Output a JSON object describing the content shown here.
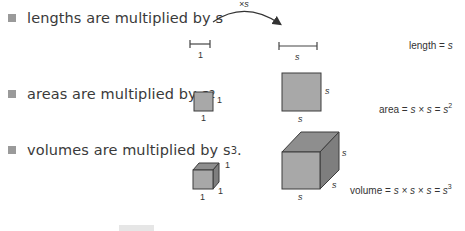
{
  "bullets": [
    {
      "text": "lengths are multiplied by s",
      "exp": ""
    },
    {
      "text": "areas are multiplied by s",
      "exp": "2"
    },
    {
      "text": "volumes are multiplied by s",
      "exp": "3",
      "suffix": "."
    }
  ],
  "arrow": {
    "label": "×s"
  },
  "length_diagram": {
    "small_label": "1",
    "large_label": "s"
  },
  "area_diagram": {
    "small_side": "1",
    "small_bottom": "1",
    "large_side": "s",
    "large_bottom": "s"
  },
  "volume_diagram": {
    "small_side": "1",
    "small_depth": "1",
    "small_bottom": "1",
    "large_side": "s",
    "large_depth": "s",
    "large_bottom": "s"
  },
  "formulas": {
    "length": {
      "lhs": "length = ",
      "rhs": "s"
    },
    "area": {
      "lhs": "area = ",
      "rhs": "s × s = s",
      "exp": "2"
    },
    "volume": {
      "lhs": "volume = ",
      "rhs": "s × s × s = s",
      "exp": "3"
    }
  },
  "colors": {
    "fill": "#a8a8a8",
    "top": "#8e8e8e",
    "side": "#7e7e7e",
    "stroke": "#3c3c3c",
    "bullet": "#9a9a9a"
  }
}
